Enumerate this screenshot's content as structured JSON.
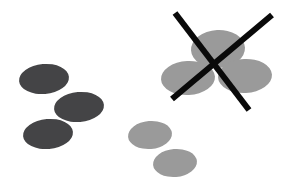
{
  "figure": {
    "canvas": {
      "width": 284,
      "height": 195,
      "background": "#ffffff"
    },
    "palette": {
      "dark_ellipse": "#444446",
      "gray_ellipse": "#9a9a9a",
      "gray_ellipse_overlap": "#8f8f8f",
      "reject_mark": "#0a0a0a"
    },
    "groups": [
      {
        "name": "dark-ellipse-group",
        "label": "dark ellipse cluster",
        "fill": "#444446",
        "accepted": true,
        "ellipses": [
          {
            "name": "dark-ellipse-1",
            "cx": 44,
            "cy": 79,
            "rx": 25,
            "ry": 15,
            "rotation": -5
          },
          {
            "name": "dark-ellipse-2",
            "cx": 79,
            "cy": 107,
            "rx": 25,
            "ry": 15,
            "rotation": -5
          },
          {
            "name": "dark-ellipse-3",
            "cx": 48,
            "cy": 134,
            "rx": 25,
            "ry": 15,
            "rotation": -5
          }
        ]
      },
      {
        "name": "gray-ellipse-group",
        "label": "gray ellipse pair",
        "fill": "#9a9a9a",
        "accepted": true,
        "ellipses": [
          {
            "name": "gray-ellipse-1",
            "cx": 150,
            "cy": 135,
            "rx": 22,
            "ry": 14,
            "rotation": -5
          },
          {
            "name": "gray-ellipse-2",
            "cx": 175,
            "cy": 163,
            "rx": 22,
            "ry": 14,
            "rotation": -5
          }
        ]
      },
      {
        "name": "rejected-ellipse-group",
        "label": "rejected gray ellipse cluster",
        "fill": "#9a9a9a",
        "accepted": false,
        "ellipses": [
          {
            "name": "rejected-ellipse-top",
            "cx": 218,
            "cy": 49,
            "rx": 27,
            "ry": 19,
            "rotation": -3
          },
          {
            "name": "rejected-ellipse-left",
            "cx": 188,
            "cy": 78,
            "rx": 27,
            "ry": 17,
            "rotation": -3
          },
          {
            "name": "rejected-ellipse-right",
            "cx": 245,
            "cy": 76,
            "rx": 27,
            "ry": 17,
            "rotation": -3
          }
        ]
      }
    ],
    "reject_mark": {
      "name": "reject-x-mark",
      "color": "#0a0a0a",
      "stroke_width": 6,
      "strokes": [
        {
          "name": "reject-stroke-down",
          "x1": 175,
          "y1": 13,
          "x2": 249,
          "y2": 110
        },
        {
          "name": "reject-stroke-up",
          "x1": 272,
          "y1": 15,
          "x2": 172,
          "y2": 99
        }
      ]
    }
  }
}
